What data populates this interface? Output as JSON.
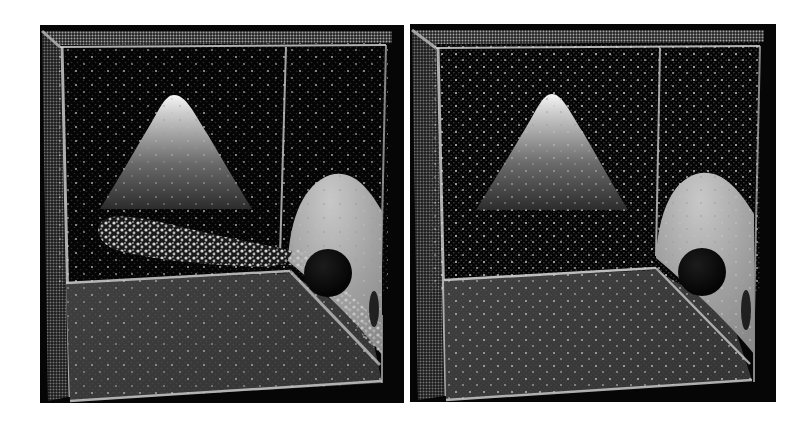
{
  "figure": {
    "background": "#ffffff",
    "panels": [
      {
        "id": "left",
        "label": "",
        "x": 40,
        "y": 25,
        "width": 364,
        "height": 378,
        "has_splash_cloud": true
      },
      {
        "id": "right",
        "label": "",
        "x": 410,
        "y": 24,
        "width": 366,
        "height": 378,
        "has_splash_cloud": false
      }
    ],
    "scene_objects": [
      "particle-box-walls",
      "cone-obstacle",
      "curved-ramp",
      "spherical-hole",
      "floor-slab"
    ],
    "colors": {
      "panel_bg": "#060606",
      "particle": "#d8d8d8",
      "cone_top": "#f4f4f4",
      "cone_base": "#2a2a2a",
      "ramp": "#a8a8a8",
      "floor": "#3a3a3a",
      "hole": "#0a0a0a"
    }
  }
}
